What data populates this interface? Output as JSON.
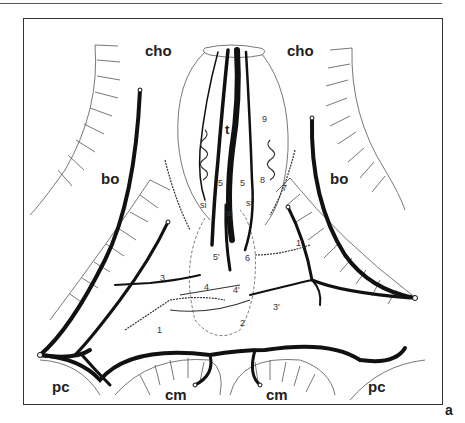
{
  "figure": {
    "panel_letter": "a",
    "regions": {
      "cho_left": "cho",
      "cho_right": "cho",
      "bo_left": "bo",
      "bo_right": "bo",
      "pc_left": "pc",
      "pc_right": "pc",
      "cm_left": "cm",
      "cm_right": "cm"
    },
    "vessel_labels": {
      "t": "t",
      "n9": "9",
      "n5a": "5",
      "n5b": "5",
      "n5prime": "5'",
      "n8": "8",
      "n7": "7",
      "n6": "6",
      "si1": "si",
      "si2": "si",
      "si3": "si",
      "n3": "3",
      "n3prime": "3'",
      "n4": "4",
      "n4prime": "4'",
      "n1": "1",
      "n1prime": "1'",
      "n2": "2"
    },
    "colors": {
      "ink": "#111111",
      "line": "#444444",
      "background": "#ffffff"
    }
  }
}
